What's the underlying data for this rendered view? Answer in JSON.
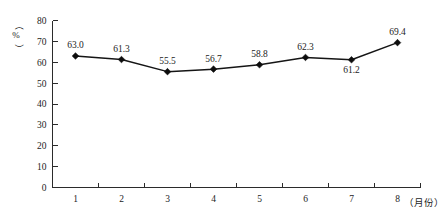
{
  "chart_data": {
    "type": "line",
    "title": "",
    "subtitle": "",
    "xlabel": "（月份）",
    "ylabel": "（%）",
    "categories": [
      "1",
      "2",
      "3",
      "4",
      "5",
      "6",
      "7",
      "8"
    ],
    "values": [
      63.0,
      61.3,
      55.5,
      56.7,
      58.8,
      62.3,
      61.2,
      69.4
    ],
    "data_labels": [
      "63.0",
      "61.3",
      "55.5",
      "56.7",
      "58.8",
      "62.3",
      "61.2",
      "69.4"
    ],
    "data_label_positions": [
      "above",
      "above",
      "above",
      "above",
      "above",
      "above",
      "below",
      "above"
    ],
    "ylim": [
      0,
      80
    ],
    "ytick_labels": [
      "0",
      "10",
      "20",
      "30",
      "40",
      "50",
      "60",
      "70",
      "80"
    ],
    "ytick_values": [
      0,
      10,
      20,
      30,
      40,
      50,
      60,
      70,
      80
    ],
    "xtick_labels": [
      "1",
      "2",
      "3",
      "4",
      "5",
      "6",
      "7",
      "8"
    ],
    "grid": false,
    "legend": false,
    "legend_position": "none",
    "marker": "diamond",
    "line_color": "#151515",
    "marker_color": "#0d0d0d",
    "axis_color": "#2b2b2b",
    "background_color": "#ffffff"
  },
  "axes": {
    "y_unit_label": "（%）",
    "x_unit_label": "（月份）"
  }
}
